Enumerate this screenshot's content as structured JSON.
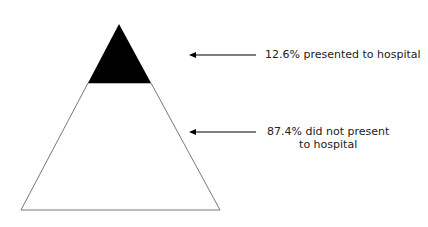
{
  "diagram": {
    "type": "iceberg-pyramid",
    "segments": [
      {
        "name": "presented",
        "label_line1": "12.6% presented to hospital",
        "value_pct": 12.6,
        "fill": "#000000"
      },
      {
        "name": "not-presented",
        "label_line1": "87.4% did not present",
        "label_line2": "to hospital",
        "value_pct": 87.4,
        "fill": "#ffffff"
      }
    ]
  }
}
